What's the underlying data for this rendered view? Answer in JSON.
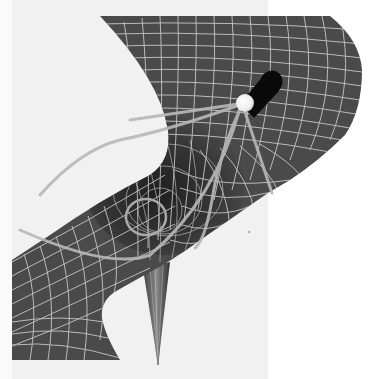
{
  "figure": {
    "elements": {
      "surface": "warped spacetime grid sheet",
      "well": "central gravity well depression",
      "funnel": "singular funnel spike beneath well",
      "light_source": "white glowing sphere",
      "cylinder": "black cylinder shadow behind sphere",
      "orbit": "looping path inside well",
      "rays": "bent light ray paths"
    }
  },
  "colors": {
    "background_left": "#f1f1f1",
    "background_right": "#ffffff",
    "surface": "#4a4a4a",
    "surface_dark": "#2e2e2e",
    "grid_line": "#cfcfcf",
    "ray": "#b8b8b8",
    "sphere": "#f8f8f8",
    "cylinder": "#0a0a0a"
  }
}
